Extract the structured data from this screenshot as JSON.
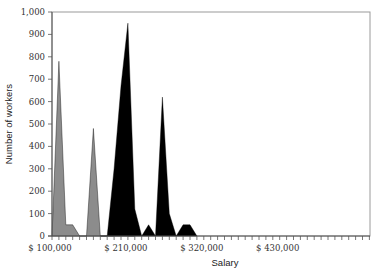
{
  "chart_data": {
    "type": "area",
    "title": "",
    "xlabel": "Salary",
    "ylabel": "Number of workers",
    "ylim": [
      0,
      1000
    ],
    "yticks": [
      0,
      100,
      200,
      300,
      400,
      500,
      600,
      700,
      800,
      900,
      1000
    ],
    "ytick_labels": [
      "0",
      "100",
      "200",
      "300",
      "400",
      "500",
      "600",
      "700",
      "800",
      "900",
      "1,000"
    ],
    "xlim": [
      100000,
      560000
    ],
    "x_bin_width": 10000,
    "xtick_labels": [
      {
        "value": 100000,
        "label": "$ 100,000"
      },
      {
        "value": 210000,
        "label": "$ 210,000"
      },
      {
        "value": 320000,
        "label": "$ 320,000"
      },
      {
        "value": 430000,
        "label": "$ 430,000"
      }
    ],
    "grid": false,
    "legend": null,
    "series": [
      {
        "name": "Series 1",
        "color": "#8c8c8c",
        "x": [
          100000,
          110000,
          120000,
          130000,
          140000,
          150000,
          160000,
          170000,
          180000,
          190000,
          200000,
          210000,
          220000
        ],
        "values": [
          0,
          780,
          50,
          50,
          0,
          0,
          480,
          0,
          0,
          0,
          600,
          0,
          0
        ]
      },
      {
        "name": "Series 2",
        "color": "#000000",
        "x": [
          170000,
          180000,
          190000,
          200000,
          210000,
          220000,
          230000,
          240000,
          250000,
          260000,
          270000,
          280000,
          290000,
          300000,
          310000
        ],
        "values": [
          0,
          0,
          300,
          670,
          950,
          120,
          0,
          50,
          0,
          620,
          100,
          0,
          50,
          50,
          0
        ]
      }
    ]
  }
}
